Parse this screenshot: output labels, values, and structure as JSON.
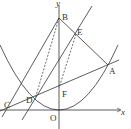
{
  "diagram": {
    "type": "coordinate-geometry",
    "colors": {
      "stroke": "#333333",
      "background": "#ffffff"
    },
    "axes": {
      "x_label": "x",
      "y_label": "y",
      "origin_label": "O"
    },
    "points": {
      "A": "A",
      "B": "B",
      "C": "C",
      "D": "D",
      "E": "E",
      "F": "F"
    }
  }
}
